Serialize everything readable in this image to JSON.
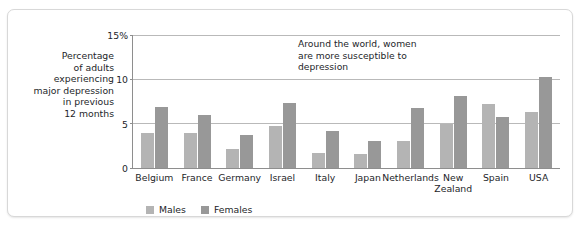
{
  "chart_data": {
    "type": "bar",
    "title": "",
    "subtitle": "",
    "xlabel": "",
    "ylabel": "Percentage\nof adults\nexperiencing\nmajor depression\nin previous\n12 months",
    "ylim": [
      0,
      15
    ],
    "yticks": [
      0,
      5,
      10,
      15
    ],
    "ytick_labels": [
      "0",
      "5",
      "10",
      "15%"
    ],
    "grid": true,
    "legend_position": "bottom-left",
    "categories": [
      "Belgium",
      "France",
      "Germany",
      "Israel",
      "Italy",
      "Japan",
      "Netherlands",
      "New\nZealand",
      "Spain",
      "USA"
    ],
    "series": [
      {
        "name": "Males",
        "color": "#b4b4b4",
        "values": [
          4.0,
          3.9,
          2.2,
          4.7,
          1.7,
          1.6,
          3.0,
          5.0,
          7.2,
          6.3
        ]
      },
      {
        "name": "Females",
        "color": "#989898",
        "values": [
          6.9,
          6.0,
          3.7,
          7.3,
          4.2,
          3.0,
          6.8,
          8.1,
          5.7,
          10.3
        ]
      }
    ],
    "annotations": [
      {
        "text": "Around the world, women\nare more susceptible to\ndepression"
      }
    ]
  }
}
